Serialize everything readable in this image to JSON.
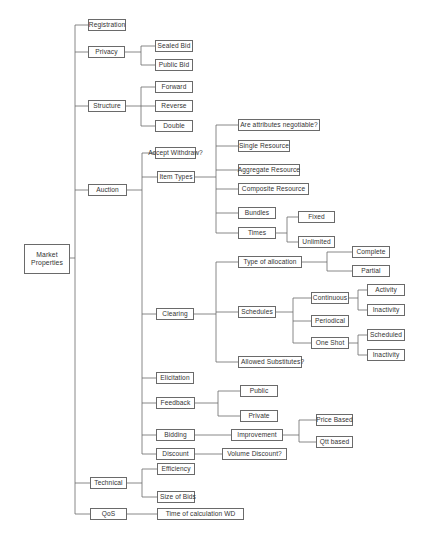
{
  "diagram": {
    "root": {
      "label": "Market Properties"
    },
    "line_color": "#6a6a6a",
    "nodes": {
      "registration": "Registration",
      "privacy": "Privacy",
      "sealed_bid": "Sealed Bid",
      "public_bid": "Public Bid",
      "structure": "Structure",
      "forward": "Forward",
      "reverse": "Reverse",
      "double": "Double",
      "auction": "Auction",
      "accept_withdraw": "Accept Withdraw?",
      "item_types": "Item Types",
      "attributes_negotiable": "Are attributes negotiable?",
      "single_resource": "Single Resource",
      "aggregate_resource": "Aggregate Resource",
      "composite_resource": "Composite Resource",
      "bundles": "Bundles",
      "times": "Times",
      "fixed": "Fixed",
      "unlimited": "Unlimited",
      "clearing": "Clearing",
      "type_of_allocation": "Type of allocation",
      "complete": "Complete",
      "partial": "Partial",
      "schedules": "Schedules",
      "continuous": "Continuous",
      "activity": "Activity",
      "inactivity_continuous": "Inactivity",
      "periodical": "Periodical",
      "one_shot": "One Shot",
      "scheduled": "Scheduled",
      "inactivity_one_shot": "Inactivity",
      "allowed_substitutes": "Allowed Substitutes?",
      "elicitation": "Elicitation",
      "feedback": "Feedback",
      "feedback_public": "Public",
      "feedback_private": "Private",
      "bidding": "Bidding",
      "improvement": "Improvement",
      "price_based": "Price Based",
      "qtt_based": "Qtt based",
      "discount": "Discount",
      "volume_discount": "Volume Discount?",
      "technical": "Technical",
      "efficiency": "Efficiency",
      "size_of_bids": "Size of Bids",
      "qos": "QoS",
      "time_of_calculation": "Time of calculation WD"
    }
  }
}
